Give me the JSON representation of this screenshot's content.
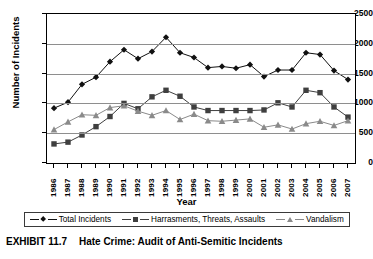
{
  "chart_data": {
    "type": "line",
    "title": "",
    "xlabel": "Year",
    "ylabel": "Number of Incidents",
    "ylim": [
      0,
      2500
    ],
    "ytick_step": 500,
    "yticks": [
      0,
      500,
      1000,
      1500,
      2000,
      2500
    ],
    "grid": true,
    "legend_position": "bottom",
    "categories": [
      "1986",
      "1987",
      "1988",
      "1989",
      "1990",
      "1991",
      "1992",
      "1993",
      "1994",
      "1995",
      "1996",
      "1997",
      "1998",
      "1999",
      "2000",
      "2001",
      "2002",
      "2003",
      "2004",
      "2005",
      "2006",
      "2007"
    ],
    "series": [
      {
        "name": "Total Incidents",
        "marker": "diamond",
        "color": "#111111",
        "values": [
          920,
          1020,
          1320,
          1440,
          1700,
          1900,
          1750,
          1870,
          2110,
          1850,
          1770,
          1600,
          1620,
          1590,
          1650,
          1450,
          1560,
          1560,
          1850,
          1820,
          1550,
          1400
        ]
      },
      {
        "name": "Harrasments, Threats, Assaults",
        "marker": "square",
        "color": "#3f3f3f",
        "values": [
          320,
          350,
          470,
          610,
          780,
          1000,
          910,
          1110,
          1220,
          1120,
          940,
          880,
          880,
          880,
          880,
          890,
          1010,
          940,
          1220,
          1180,
          940,
          770
        ]
      },
      {
        "name": "Vandalism",
        "marker": "triangle",
        "color": "#8a8a8a",
        "values": [
          560,
          690,
          810,
          800,
          930,
          960,
          870,
          800,
          880,
          730,
          820,
          710,
          700,
          720,
          740,
          600,
          640,
          570,
          660,
          700,
          630,
          710
        ]
      }
    ]
  },
  "axes": {
    "ylabel": "Number of Incidents",
    "xlabel": "Year"
  },
  "legend": {
    "items": [
      {
        "label": "Total Incidents"
      },
      {
        "label": "Harrasments, Threats, Assaults"
      },
      {
        "label": "Vandalism"
      }
    ]
  },
  "caption": {
    "number": "EXHIBIT 11.7",
    "text": "Hate Crime: Audit of Anti-Semitic Incidents"
  }
}
